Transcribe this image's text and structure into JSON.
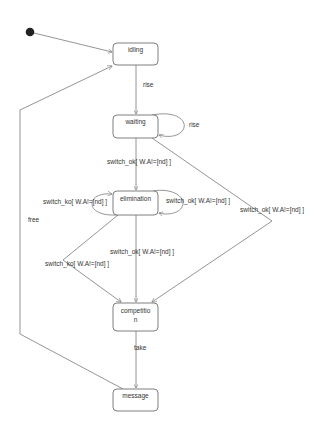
{
  "diagram": {
    "type": "UML state machine",
    "initial_state": {
      "x": 30,
      "y": 32,
      "r": 4
    },
    "states": [
      {
        "id": "idling",
        "label": "idling",
        "x": 113,
        "y": 43,
        "w": 45,
        "h": 22
      },
      {
        "id": "waiting",
        "label": "waiting",
        "x": 113,
        "y": 115,
        "w": 45,
        "h": 23
      },
      {
        "id": "elimination",
        "label": "elimination",
        "x": 113,
        "y": 191,
        "w": 45,
        "h": 24
      },
      {
        "id": "competition",
        "label_line1": "competitio",
        "label_line2": "n",
        "x": 113,
        "y": 303,
        "w": 45,
        "h": 28
      },
      {
        "id": "message",
        "label": "message",
        "x": 113,
        "y": 389,
        "w": 45,
        "h": 22
      }
    ],
    "transitions": [
      {
        "from": "initial",
        "to": "idling",
        "label": ""
      },
      {
        "from": "idling",
        "to": "waiting",
        "label": "rise"
      },
      {
        "from": "waiting",
        "to": "waiting",
        "label": "rise"
      },
      {
        "from": "waiting",
        "to": "elimination",
        "label": "switch_ok[ W.A!=[nd] ]"
      },
      {
        "from": "waiting",
        "to": "competition",
        "label": "switch_ok[ W.A!=[nd] ]"
      },
      {
        "from": "elimination",
        "to": "elimination",
        "label": "switch_ko[ W.A!=[nd] ]"
      },
      {
        "from": "elimination",
        "to": "elimination",
        "label": "switch_ok[ W.A!=[nd] ]"
      },
      {
        "from": "elimination",
        "to": "competition",
        "label": "switch_ok[ W.A!=[nd] ]"
      },
      {
        "from": "elimination",
        "to": "competition",
        "label": "switch_ko[ W.A!=[nd] ]"
      },
      {
        "from": "competition",
        "to": "message",
        "label": "take"
      },
      {
        "from": "message",
        "to": "idling",
        "label": "free"
      }
    ]
  },
  "labels": {
    "idling": "idling",
    "waiting": "waiting",
    "elimination": "elimination",
    "competition_1": "competitio",
    "competition_2": "n",
    "message": "message",
    "rise_1": "rise",
    "rise_2": "rise",
    "sw_ok_wait_elim": "switch_ok[ W.A!=[nd] ]",
    "sw_ko_elim_loop": "switch_ko[ W.A!=[nd] ]",
    "sw_ok_elim_loop": "switch_ok[ W.A!=[nd] ]",
    "sw_ok_wait_comp": "switch_ok[ W.A!=[nd] ]",
    "sw_ok_elim_comp": "switch_ok[ W.A!=[nd] ]",
    "sw_ko_elim_comp": "switch_ko[ W.A!=[nd] ]",
    "take": "take",
    "free": "free"
  },
  "colors": {
    "line": "#7a7a7a",
    "box_stroke": "#6f6f6f",
    "text": "#333333",
    "initial": "#222222",
    "background": "#ffffff"
  }
}
